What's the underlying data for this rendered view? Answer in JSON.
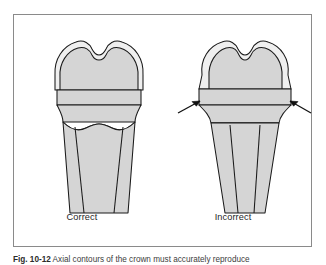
{
  "figure": {
    "caption_number": "Fig. 10-12",
    "caption_text": "   Axial contours of the crown must accurately reproduce",
    "frame_color": "#8a8a8a",
    "background_color": "#ffffff"
  },
  "diagrams": [
    {
      "id": "correct",
      "label": "Correct",
      "tooth_fill": "#d5d5d5",
      "crown_fill": "#f2f2f2",
      "outline_color": "#1a1a1a",
      "has_arrows": false,
      "arrow_count": 0
    },
    {
      "id": "incorrect",
      "label": "Incorrect",
      "tooth_fill": "#d5d5d5",
      "crown_fill": "#f2f2f2",
      "outline_color": "#1a1a1a",
      "has_arrows": true,
      "arrow_count": 2
    }
  ],
  "colors": {
    "outline": "#1a1a1a",
    "shade_body": "#d5d5d5",
    "shade_crown": "#efefef",
    "frame": "#8a8a8a",
    "arrow": "#111111",
    "label_text": "#262626"
  }
}
